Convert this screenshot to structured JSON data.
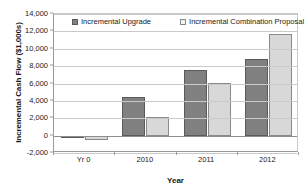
{
  "chart_data": {
    "type": "bar",
    "title": "",
    "xlabel": "Year",
    "ylabel": "Incremental Cash Flow ($1,000s)",
    "categories": [
      "Yr 0",
      "2010",
      "2011",
      "2012"
    ],
    "series": [
      {
        "name": "Incremental Upgrade",
        "values": [
          -300,
          4500,
          7500,
          8800
        ],
        "color": "#808080"
      },
      {
        "name": "Incremental Combination Proposal",
        "values": [
          -500,
          2200,
          6100,
          11700
        ],
        "color": "#d8d8d8"
      }
    ],
    "ylim": [
      -2000,
      14000
    ],
    "yticks": [
      -2000,
      0,
      2000,
      4000,
      6000,
      8000,
      10000,
      12000,
      14000
    ],
    "ytick_labels": [
      "-2,000",
      "0",
      "2,000",
      "4,000",
      "6,000",
      "8,000",
      "10,000",
      "12,000",
      "14,000"
    ],
    "grid": true,
    "legend_position": "top-inside"
  },
  "legend": {
    "items": [
      {
        "label": "Incremental Upgrade",
        "marker": "dark-swatch-icon"
      },
      {
        "label": "Incremental Combination Proposal",
        "marker": "light-swatch-icon"
      }
    ]
  }
}
